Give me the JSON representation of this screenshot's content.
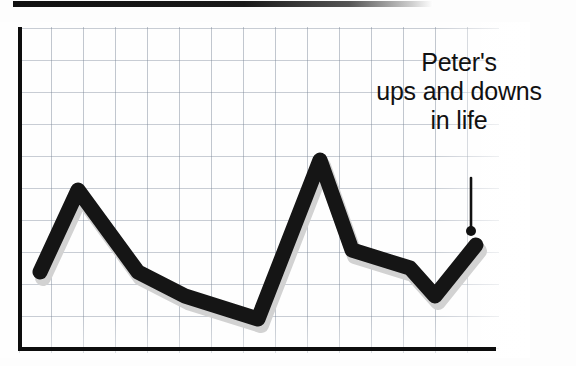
{
  "page": {
    "width": 576,
    "height": 366,
    "background_color": "#fdfdfd"
  },
  "top_bar": {
    "name": "page-header-rule",
    "color": "#111111"
  },
  "annotation": {
    "line1": "Peter's",
    "line2": "ups and downs",
    "line3": "in life",
    "full_text": "Peter's ups and downs in life",
    "color": "#111111",
    "pointer": {
      "icon": "pointer-line-with-dot",
      "x": 471,
      "line_top_y": 178,
      "line_bottom_y": 227,
      "dot_y": 231,
      "dot_radius": 5
    }
  },
  "chart_data": {
    "type": "line",
    "title": "Peter's ups and downs in life",
    "xlabel": "",
    "ylabel": "",
    "grid": true,
    "grid_spacing_px": 32,
    "legend": "none",
    "axis_color": "#0d0d0d",
    "line_color": "#151515",
    "line_width_px": 15,
    "shadow_color": "#d2d2d2",
    "x": [
      0,
      1.2,
      3.1,
      4.6,
      7.4,
      9.4,
      10.4,
      12.2,
      14.2,
      15.5
    ],
    "y": [
      2.4,
      5.0,
      3.0,
      2.1,
      1.4,
      6.0,
      3.7,
      3.1,
      1.7,
      3.3
    ],
    "xlim": [
      0,
      15.5
    ],
    "ylim": [
      0,
      10
    ],
    "points_px": [
      {
        "x": 40,
        "y": 272
      },
      {
        "x": 78,
        "y": 190
      },
      {
        "x": 138,
        "y": 272
      },
      {
        "x": 185,
        "y": 296
      },
      {
        "x": 258,
        "y": 319
      },
      {
        "x": 320,
        "y": 160
      },
      {
        "x": 352,
        "y": 250
      },
      {
        "x": 410,
        "y": 268
      },
      {
        "x": 435,
        "y": 296
      },
      {
        "x": 476,
        "y": 245
      }
    ]
  }
}
